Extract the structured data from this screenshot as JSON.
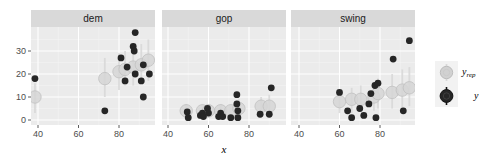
{
  "chart_data": {
    "type": "scatter",
    "title": "",
    "xlabel": "x",
    "ylabel": "",
    "facets": [
      "dem",
      "gop",
      "swing"
    ],
    "xlim": [
      37,
      97
    ],
    "ylim": [
      -2,
      40
    ],
    "x_ticks": [
      40,
      60,
      80
    ],
    "y_ticks": [
      0,
      10,
      20,
      30
    ],
    "grid": true,
    "legend": {
      "position": "right",
      "entries": [
        {
          "label": "y_rep",
          "label_main": "y",
          "label_sub": "rep",
          "color": "#d1d1d1",
          "stroke": "#bdbdbd"
        },
        {
          "label": "y",
          "label_main": "y",
          "label_sub": "",
          "color": "#262626",
          "stroke": "#111111"
        }
      ]
    },
    "panels": [
      {
        "name": "dem",
        "y": [
          {
            "x": 38.5,
            "y": 18
          },
          {
            "x": 73,
            "y": 4
          },
          {
            "x": 81,
            "y": 27
          },
          {
            "x": 84,
            "y": 23
          },
          {
            "x": 83,
            "y": 17
          },
          {
            "x": 87,
            "y": 32
          },
          {
            "x": 87.5,
            "y": 30
          },
          {
            "x": 88,
            "y": 38
          },
          {
            "x": 88,
            "y": 20
          },
          {
            "x": 91,
            "y": 17
          },
          {
            "x": 92,
            "y": 24
          },
          {
            "x": 92,
            "y": 10
          },
          {
            "x": 95,
            "y": 20
          }
        ],
        "y_rep": [
          {
            "x": 38.5,
            "y": 10,
            "lo": 3,
            "hi": 16
          },
          {
            "x": 73,
            "y": 18,
            "lo": 10,
            "hi": 27
          },
          {
            "x": 80,
            "y": 21,
            "lo": 13,
            "hi": 29
          },
          {
            "x": 83,
            "y": 22,
            "lo": 15,
            "hi": 30
          },
          {
            "x": 87,
            "y": 23,
            "lo": 15,
            "hi": 32
          },
          {
            "x": 91,
            "y": 24,
            "lo": 16,
            "hi": 33
          },
          {
            "x": 94.5,
            "y": 26,
            "lo": 17,
            "hi": 35
          }
        ]
      },
      {
        "name": "gop",
        "y": [
          {
            "x": 49.5,
            "y": 3.5
          },
          {
            "x": 50,
            "y": 1
          },
          {
            "x": 56,
            "y": 2
          },
          {
            "x": 57,
            "y": 3
          },
          {
            "x": 57.5,
            "y": 1.5
          },
          {
            "x": 59.5,
            "y": 5
          },
          {
            "x": 60,
            "y": 3
          },
          {
            "x": 65,
            "y": 1.5
          },
          {
            "x": 66,
            "y": 3
          },
          {
            "x": 67,
            "y": 1.5
          },
          {
            "x": 71,
            "y": 1
          },
          {
            "x": 74,
            "y": 11
          },
          {
            "x": 74,
            "y": 7
          },
          {
            "x": 74.5,
            "y": 4
          },
          {
            "x": 74.5,
            "y": 1
          },
          {
            "x": 85.5,
            "y": 2.5
          },
          {
            "x": 90,
            "y": 2.5
          },
          {
            "x": 91,
            "y": 14
          }
        ],
        "y_rep": [
          {
            "x": 49,
            "y": 4,
            "lo": 1,
            "hi": 7
          },
          {
            "x": 57,
            "y": 4,
            "lo": 1,
            "hi": 7
          },
          {
            "x": 60,
            "y": 4,
            "lo": 1,
            "hi": 7
          },
          {
            "x": 66,
            "y": 4,
            "lo": 1,
            "hi": 7
          },
          {
            "x": 71,
            "y": 4,
            "lo": 1,
            "hi": 7
          },
          {
            "x": 75,
            "y": 5,
            "lo": 1,
            "hi": 9
          },
          {
            "x": 86,
            "y": 6,
            "lo": 2,
            "hi": 10
          },
          {
            "x": 90,
            "y": 6,
            "lo": 2,
            "hi": 11
          }
        ]
      },
      {
        "name": "swing",
        "y": [
          {
            "x": 60,
            "y": 12
          },
          {
            "x": 64,
            "y": 4
          },
          {
            "x": 66,
            "y": 1
          },
          {
            "x": 70,
            "y": 5
          },
          {
            "x": 72,
            "y": 2
          },
          {
            "x": 74.5,
            "y": 7
          },
          {
            "x": 75.5,
            "y": 11.5
          },
          {
            "x": 77.5,
            "y": 15
          },
          {
            "x": 78,
            "y": 1
          },
          {
            "x": 79,
            "y": 16
          },
          {
            "x": 86.5,
            "y": 26.5
          },
          {
            "x": 91.5,
            "y": 4
          },
          {
            "x": 94.5,
            "y": 34.5
          }
        ],
        "y_rep": [
          {
            "x": 60,
            "y": 8,
            "lo": 3,
            "hi": 13
          },
          {
            "x": 66,
            "y": 9,
            "lo": 3,
            "hi": 14
          },
          {
            "x": 70.5,
            "y": 9,
            "lo": 4,
            "hi": 15
          },
          {
            "x": 77,
            "y": 10,
            "lo": 4,
            "hi": 16
          },
          {
            "x": 79,
            "y": 11.5,
            "lo": 5,
            "hi": 18
          },
          {
            "x": 86,
            "y": 12,
            "lo": 5,
            "hi": 20
          },
          {
            "x": 91,
            "y": 13,
            "lo": 5,
            "hi": 22
          },
          {
            "x": 94.5,
            "y": 14,
            "lo": 6,
            "hi": 23
          }
        ]
      }
    ]
  },
  "colors": {
    "panel_bg": "#ebebeb",
    "strip_bg": "#d9d9d9",
    "grid_major": "#ffffff",
    "grid_minor": "#f3f3f3",
    "y_point": "#262626",
    "yrep_fill": "#d6d6d6",
    "yrep_stroke": "#c2c2c2",
    "yrep_line": "#d9d9d9"
  }
}
